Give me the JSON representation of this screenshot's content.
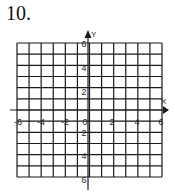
{
  "problem_number": "10.",
  "graph": {
    "x_axis_label": "X",
    "y_axis_label": "Y",
    "x_tick_labels": [
      "-6",
      "-4",
      "-2",
      "0",
      "2",
      "4",
      "6"
    ],
    "y_tick_labels_upper": [
      "6",
      "4",
      "2"
    ],
    "y_tick_labels_lower": [
      "2",
      "4",
      "6"
    ],
    "grid_columns": 12,
    "grid_rows": 12,
    "line_color": "#1a1a1a"
  }
}
